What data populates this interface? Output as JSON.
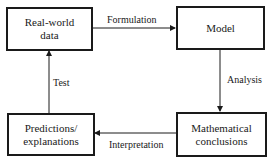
{
  "diagram": {
    "nodes": [
      {
        "id": "real-world-data",
        "lines": [
          "Real-world",
          "data"
        ]
      },
      {
        "id": "model",
        "lines": [
          "Model"
        ]
      },
      {
        "id": "mathematical-conclusions",
        "lines": [
          "Mathematical",
          "conclusions"
        ]
      },
      {
        "id": "predictions-explanations",
        "lines": [
          "Predictions/",
          "explanations"
        ]
      }
    ],
    "edges": [
      {
        "from": "real-world-data",
        "to": "model",
        "label": "Formulation"
      },
      {
        "from": "model",
        "to": "mathematical-conclusions",
        "label": "Analysis"
      },
      {
        "from": "mathematical-conclusions",
        "to": "predictions-explanations",
        "label": "Interpretation"
      },
      {
        "from": "predictions-explanations",
        "to": "real-world-data",
        "label": "Test"
      }
    ],
    "colors": {
      "stroke": "#1a1a1a",
      "background": "#ffffff"
    }
  }
}
